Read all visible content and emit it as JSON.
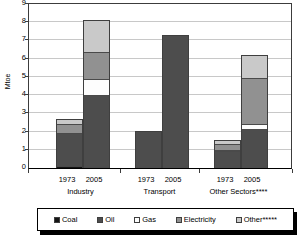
{
  "chart_data": {
    "type": "bar",
    "subtype": "stacked-vertical",
    "title": "",
    "xlabel": "",
    "ylabel": "Mtoe",
    "ylim": [
      0,
      9
    ],
    "ytick_labels": [
      "0",
      "1",
      "2",
      "3",
      "4",
      "5",
      "6",
      "7",
      "8",
      "9"
    ],
    "ytick_values": [
      0,
      1,
      2,
      3,
      4,
      5,
      6,
      7,
      8,
      9
    ],
    "grid": true,
    "legend_position": "bottom",
    "groups": [
      {
        "label": "Industry",
        "years": [
          "1973",
          "2005"
        ]
      },
      {
        "label": "Transport",
        "years": [
          "1973",
          "2005"
        ]
      },
      {
        "label": "Other Sectors****",
        "years": [
          "1973",
          "2005"
        ]
      }
    ],
    "categories": [
      "Industry 1973",
      "Industry 2005",
      "Transport 1973",
      "Transport 2005",
      "Other Sectors 1973",
      "Other Sectors 2005"
    ],
    "series": [
      {
        "name": "Coal",
        "color": "#141414",
        "values": [
          0.12,
          0.08,
          0.0,
          0.0,
          0.0,
          0.0
        ]
      },
      {
        "name": "Oil",
        "color": "#4d4d4d",
        "values": [
          1.78,
          3.92,
          2.0,
          7.25,
          0.95,
          2.12
        ]
      },
      {
        "name": "Gas",
        "color": "#fdfdfd",
        "values": [
          0.0,
          0.88,
          0.0,
          0.0,
          0.05,
          0.32
        ]
      },
      {
        "name": "Electricity",
        "color": "#919191",
        "values": [
          0.52,
          1.5,
          0.0,
          0.0,
          0.3,
          2.51
        ]
      },
      {
        "name": "Other*****",
        "color": "#c9c9c9",
        "values": [
          0.23,
          1.67,
          0.0,
          0.0,
          0.18,
          1.2
        ]
      }
    ],
    "totals": [
      2.65,
      8.05,
      2.0,
      7.25,
      1.48,
      6.15
    ]
  },
  "legend": {
    "items": [
      {
        "label": "Coal",
        "color": "#141414"
      },
      {
        "label": "Oil",
        "color": "#4d4d4d"
      },
      {
        "label": "Gas",
        "color": "#fdfdfd"
      },
      {
        "label": "Electricity",
        "color": "#919191"
      },
      {
        "label": "Other*****",
        "color": "#c9c9c9"
      }
    ]
  },
  "axis": {
    "y_title": "Mtoe",
    "y_ticks": [
      "9",
      "8",
      "7",
      "6",
      "5",
      "4",
      "3",
      "2",
      "1",
      "0"
    ]
  },
  "xaxis": {
    "year_labels": [
      "1973",
      "2005",
      "1973",
      "2005",
      "1973",
      "2005"
    ],
    "group_labels": [
      "Industry",
      "Transport",
      "Other Sectors****"
    ]
  }
}
